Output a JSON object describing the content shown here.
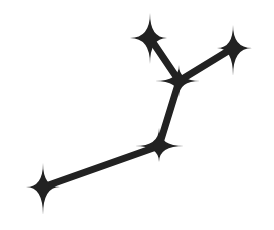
{
  "diagram": {
    "type": "constellation",
    "background": "#ffffff",
    "ink_color": "#222222",
    "edge_width": 7,
    "stars": [
      {
        "id": "top-left",
        "x": 150,
        "y": 38,
        "up": 25,
        "down": 26,
        "left": 20,
        "right": 17
      },
      {
        "id": "top-right",
        "x": 233,
        "y": 48,
        "up": 23,
        "down": 28,
        "left": 16,
        "right": 19
      },
      {
        "id": "hub",
        "x": 179,
        "y": 81,
        "up": 16,
        "down": 16,
        "left": 24,
        "right": 21
      },
      {
        "id": "lower-middle",
        "x": 159,
        "y": 146,
        "up": 18,
        "down": 16,
        "left": 24,
        "right": 25
      },
      {
        "id": "bottom-left",
        "x": 43,
        "y": 187,
        "up": 24,
        "down": 28,
        "left": 17,
        "right": 17
      }
    ],
    "edges": [
      {
        "from": "top-left",
        "to": "hub"
      },
      {
        "from": "top-right",
        "to": "hub"
      },
      {
        "from": "hub",
        "to": "lower-middle"
      },
      {
        "from": "lower-middle",
        "to": "bottom-left"
      }
    ]
  }
}
